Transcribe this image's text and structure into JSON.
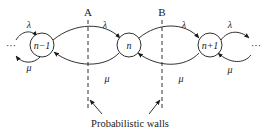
{
  "diagram": {
    "type": "birth-death chain",
    "nodes": [
      {
        "id": "n-1",
        "label": "n−1"
      },
      {
        "id": "n",
        "label": "n"
      },
      {
        "id": "n+1",
        "label": "n+1"
      }
    ],
    "ellipsis_left": "···",
    "ellipsis_right": "···",
    "rates": {
      "birth": "λ",
      "death": "μ"
    },
    "walls": [
      {
        "id": "A",
        "label": "A"
      },
      {
        "id": "B",
        "label": "B"
      }
    ],
    "walls_caption": "Probabilistic walls",
    "colors": {
      "stroke": "#1a1a1a",
      "background": "#ffffff"
    }
  }
}
